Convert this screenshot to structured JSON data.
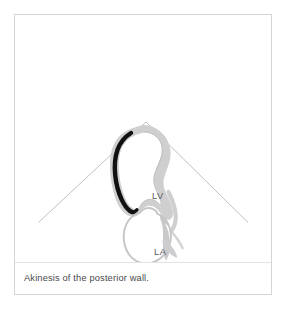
{
  "figure": {
    "caption": "Akinesis of the posterior wall.",
    "frame_color": "#d5d5d6",
    "divider_color": "#e3e3e4",
    "background_color": "#ffffff"
  },
  "scan": {
    "type": "echocardiogram-sector-schematic",
    "view": "apical-two-chamber",
    "sector": {
      "outline_color": "#b9b9bb",
      "apex": {
        "x": 146,
        "y": 122
      },
      "left_foot": {
        "x": 38,
        "y": 222
      },
      "right_foot": {
        "x": 248,
        "y": 222
      }
    }
  },
  "anatomy": {
    "myocardium_color": "#cfcfd0",
    "endocardium_color": "#c2c2c4",
    "akinetic_segment_color": "#111111",
    "akinetic_segment_name": "posterior wall",
    "chambers": [
      {
        "id": "lv",
        "label": "LV",
        "name": "left ventricle"
      },
      {
        "id": "la",
        "label": "LA",
        "name": "left atrium"
      }
    ]
  },
  "labels": {
    "lv": "LV",
    "la": "LA"
  }
}
